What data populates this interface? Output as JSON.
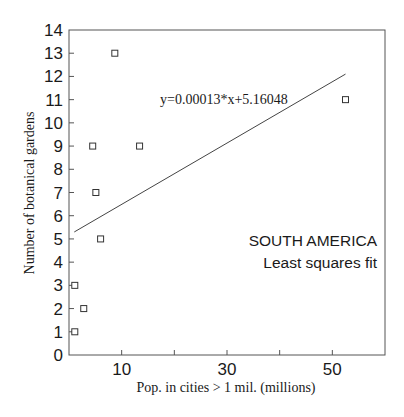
{
  "chart_data": {
    "type": "scatter",
    "title": "",
    "xlabel": "Pop. in cities > 1 mil. (millions)",
    "ylabel": "Number of botanical gardens",
    "xlim": [
      0,
      60
    ],
    "ylim": [
      0,
      14
    ],
    "grid": false,
    "x_tick_labels": [
      "10",
      "30",
      "50"
    ],
    "x_ticks": [
      10,
      20,
      30,
      40,
      50
    ],
    "y_tick_labels": [
      "0",
      "1",
      "2",
      "3",
      "4",
      "5",
      "6",
      "7",
      "8",
      "9",
      "10",
      "11",
      "12",
      "13",
      "14"
    ],
    "series": [
      {
        "name": "South America",
        "marker": "open-square",
        "points": [
          {
            "x": 1.1,
            "y": 1
          },
          {
            "x": 2.8,
            "y": 2
          },
          {
            "x": 1.1,
            "y": 3
          },
          {
            "x": 6.0,
            "y": 5
          },
          {
            "x": 5.1,
            "y": 7
          },
          {
            "x": 4.5,
            "y": 9
          },
          {
            "x": 13.4,
            "y": 9
          },
          {
            "x": 8.7,
            "y": 13
          },
          {
            "x": 52.5,
            "y": 11
          }
        ]
      }
    ],
    "fit_line": {
      "equation": "y=0.00013*x+5.16048",
      "x_start": 1.0,
      "y_start": 5.3,
      "x_end": 52.5,
      "y_end": 12.1
    },
    "annotations": [
      "SOUTH AMERICA",
      "Least squares fit"
    ]
  },
  "text": {
    "equation": "y=0.00013*x+5.16048",
    "region": "SOUTH AMERICA",
    "method": "Least squares fit",
    "xlabel": "Pop. in cities > 1 mil. (millions)",
    "ylabel": "Number of botanical gardens"
  }
}
